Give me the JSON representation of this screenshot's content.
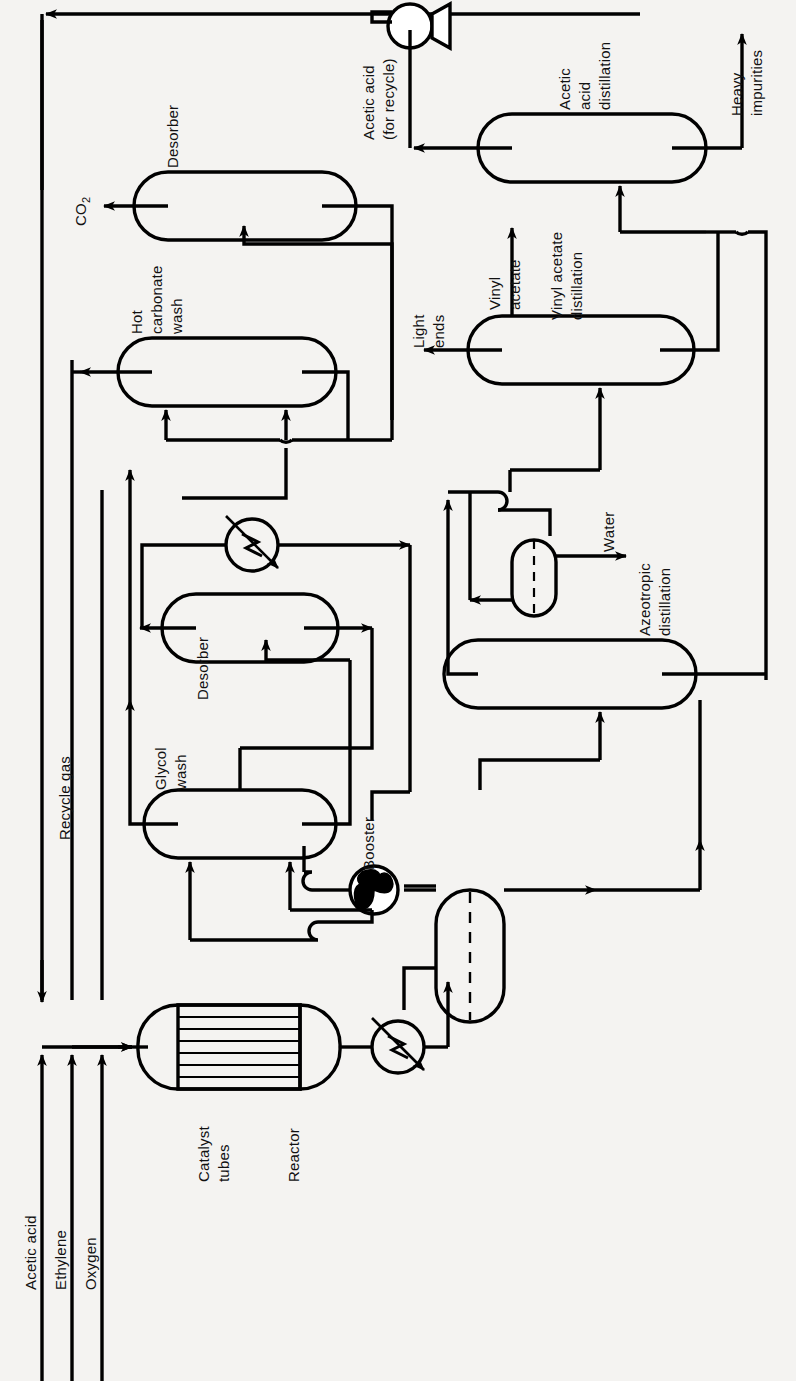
{
  "diagram": {
    "type": "process-flow-diagram",
    "orientation": "landscape-rotated-90",
    "line_color": "#000000",
    "background_color": "#f4f3f1"
  },
  "feeds": [
    {
      "id": "acetic-acid",
      "label": "Acetic acid"
    },
    {
      "id": "ethylene",
      "label": "Ethylene"
    },
    {
      "id": "oxygen",
      "label": "Oxygen"
    }
  ],
  "equipment": [
    {
      "id": "reactor",
      "label": "Reactor",
      "shape": "horizontal-vessel"
    },
    {
      "id": "catalyst-tubes",
      "label": "Catalyst\ntubes",
      "shape": "tube-bundle"
    },
    {
      "id": "reactor-cooler",
      "label": "",
      "shape": "heat-exchanger"
    },
    {
      "id": "separator",
      "label": "",
      "shape": "vertical-vessel"
    },
    {
      "id": "booster",
      "label": "Booster",
      "shape": "compressor"
    },
    {
      "id": "glycol-wash",
      "label": "Glycol\nwash",
      "shape": "column"
    },
    {
      "id": "glycol-desorber",
      "label": "Desorber",
      "shape": "column"
    },
    {
      "id": "glycol-heater",
      "label": "",
      "shape": "heat-exchanger"
    },
    {
      "id": "hot-carbonate-wash",
      "label": "Hot\ncarbonate\nwash",
      "shape": "column"
    },
    {
      "id": "carbonate-desorber",
      "label": "Desorber",
      "shape": "column"
    },
    {
      "id": "acetic-acid-pump",
      "label": "",
      "shape": "pump"
    },
    {
      "id": "azeotropic-distillation",
      "label": "Azeotropic\ndistillation",
      "shape": "column"
    },
    {
      "id": "decanter",
      "label": "",
      "shape": "decanter"
    },
    {
      "id": "vinyl-acetate-distillation",
      "label": "Vinyl acetate\ndistillation",
      "shape": "column"
    },
    {
      "id": "acetic-acid-distillation",
      "label": "Acetic\nacid\ndistillation",
      "shape": "column"
    }
  ],
  "labels": {
    "acetic_acid_feed": "Acetic acid",
    "ethylene_feed": "Ethylene",
    "oxygen_feed": "Oxygen",
    "catalyst_tubes": "Catalyst",
    "catalyst_tubes_2": "tubes",
    "reactor": "Reactor",
    "booster": "Booster",
    "glycol_wash": "Glycol",
    "glycol_wash_2": "wash",
    "desorber_glycol": "Desorber",
    "hot_carbonate_1": "Hot",
    "hot_carbonate_2": "carbonate",
    "hot_carbonate_3": "wash",
    "desorber_carbonate": "Desorber",
    "recycle_gas": "Recycle gas",
    "co2": "CO",
    "co2_sub": "2",
    "acetic_acid_recycle_1": "Acetic acid",
    "acetic_acid_recycle_2": "(for recycle)",
    "azeotropic_1": "Azeotropic",
    "azeotropic_2": "distillation",
    "water": "Water",
    "vinyl_acetate_col_1": "Vinyl acetate",
    "vinyl_acetate_col_2": "distillation",
    "vinyl_acetate_out_1": "Vinyl",
    "vinyl_acetate_out_2": "acetate",
    "light_ends_1": "Light",
    "light_ends_2": "ends",
    "acetic_acid_col_1": "Acetic",
    "acetic_acid_col_2": "acid",
    "acetic_acid_col_3": "distillation",
    "heavy_1": "Heavy",
    "heavy_2": "impurities"
  },
  "streams": [
    {
      "id": "acetic-acid-feed",
      "from": "feed",
      "to": "reactor"
    },
    {
      "id": "ethylene-feed",
      "from": "feed",
      "to": "reactor"
    },
    {
      "id": "oxygen-feed",
      "from": "feed",
      "to": "reactor"
    },
    {
      "id": "recycle-gas",
      "from": "hot-carbonate-wash",
      "to": "reactor",
      "label": "Recycle gas"
    },
    {
      "id": "co2-vent",
      "from": "carbonate-desorber",
      "to": "vent",
      "label": "CO2"
    },
    {
      "id": "reactor-effluent",
      "from": "reactor",
      "to": "separator"
    },
    {
      "id": "booster-gas",
      "from": "separator",
      "to": "glycol-wash"
    },
    {
      "id": "acetic-acid-recycle",
      "from": "acetic-acid-distillation",
      "to": "feed",
      "label": "Acetic acid (for recycle)"
    },
    {
      "id": "water-out",
      "from": "decanter",
      "to": "out",
      "label": "Water"
    },
    {
      "id": "light-ends",
      "from": "vinyl-acetate-distillation",
      "to": "out",
      "label": "Light ends"
    },
    {
      "id": "vinyl-acetate-product",
      "from": "vinyl-acetate-distillation",
      "to": "product",
      "label": "Vinyl acetate"
    },
    {
      "id": "heavy-impurities",
      "from": "acetic-acid-distillation",
      "to": "out",
      "label": "Heavy impurities"
    }
  ]
}
